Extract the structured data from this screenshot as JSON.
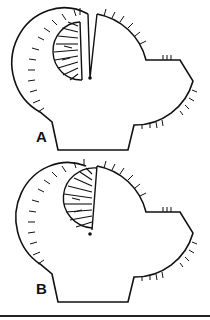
{
  "top_text_fragment": "",
  "panels": [
    {
      "label": "A",
      "variant": "open-slit",
      "label_pos": [
        36,
        130
      ],
      "offset_y": 0
    },
    {
      "label": "B",
      "variant": "closed-slit",
      "label_pos": [
        36,
        283
      ],
      "offset_y": 152
    }
  ],
  "colors": {
    "stroke": "#111111",
    "background": "#ffffff"
  }
}
